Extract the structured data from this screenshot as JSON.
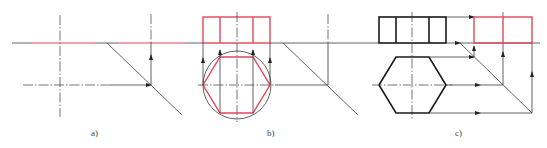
{
  "figure": {
    "panels": [
      {
        "id": "a",
        "label": "a)",
        "description": "45-degree miter line construction"
      },
      {
        "id": "b",
        "label": "b)",
        "description": "Hexagon inscribed in circle projected to front view (red)"
      },
      {
        "id": "c",
        "label": "c)",
        "description": "Hexagonal prism projected to side view via miter line (red)"
      }
    ],
    "colors": {
      "construction_line": "#3a3a3a",
      "visible_outline": "#1a1a1a",
      "highlight": "#e0475b"
    }
  }
}
